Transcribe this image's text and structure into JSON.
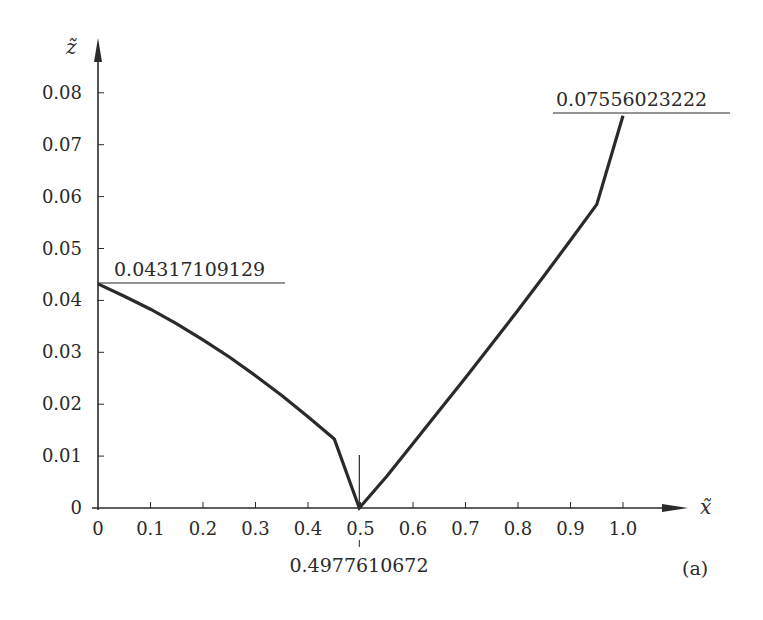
{
  "chart_data": {
    "type": "line",
    "title": "",
    "panel_label": "(a)",
    "xlabel": "x̃",
    "ylabel": "z̃",
    "xlim": [
      0,
      1.1
    ],
    "ylim": [
      0,
      0.085
    ],
    "grid": false,
    "legend": null,
    "x_ticks": [
      "0",
      "0.1",
      "0.2",
      "0.3",
      "0.4",
      "0.5",
      "0.6",
      "0.7",
      "0.8",
      "0.9",
      "1.0"
    ],
    "y_ticks": [
      "0",
      "0.01",
      "0.02",
      "0.03",
      "0.04",
      "0.05",
      "0.06",
      "0.07",
      "0.08"
    ],
    "series": [
      {
        "name": "z(x)",
        "x": [
          0,
          0.05,
          0.1,
          0.15,
          0.2,
          0.25,
          0.3,
          0.35,
          0.4,
          0.45,
          0.4977610672,
          0.55,
          0.6,
          0.65,
          0.7,
          0.75,
          0.8,
          0.85,
          0.9,
          0.95,
          1.0
        ],
        "y": [
          0.04317109129,
          0.0408,
          0.0383,
          0.0355,
          0.0324,
          0.0291,
          0.0255,
          0.0217,
          0.0176,
          0.0133,
          0.0,
          0.0061,
          0.0124,
          0.0188,
          0.0251,
          0.0316,
          0.0381,
          0.0448,
          0.0516,
          0.0585,
          0.07556023222
        ]
      }
    ],
    "annotations": [
      {
        "text": "0.04317109129",
        "x": 0,
        "y": 0.04317109129,
        "kind": "value-at-left-end"
      },
      {
        "text": "0.07556023222",
        "x": 1.0,
        "y": 0.07556023222,
        "kind": "value-at-right-end"
      },
      {
        "text": "0.4977610672",
        "x": 0.4977610672,
        "y": 0,
        "kind": "minimum-location"
      }
    ]
  },
  "labels": {
    "x_axis_title": "x̃",
    "y_axis_title": "z̃",
    "panel": "(a)",
    "left_value": "0.04317109129",
    "right_value": "0.07556023222",
    "min_location": "0.4977610672",
    "x_ticks": [
      "0",
      "0.1",
      "0.2",
      "0.3",
      "0.4",
      "0.5",
      "0.6",
      "0.7",
      "0.8",
      "0.9",
      "1.0"
    ],
    "y_ticks": [
      "0",
      "0.01",
      "0.02",
      "0.03",
      "0.04",
      "0.05",
      "0.06",
      "0.07",
      "0.08"
    ]
  },
  "colors": {
    "ink": "#2a2a2a",
    "background": "#ffffff"
  }
}
